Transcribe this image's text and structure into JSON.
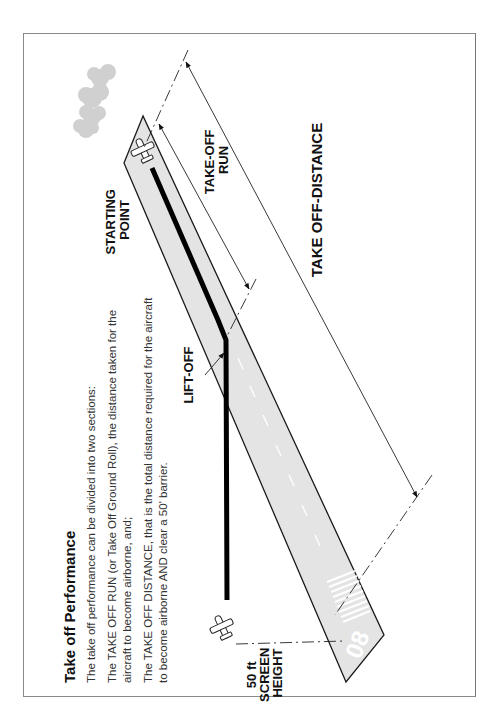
{
  "title": "Take off Performance",
  "paragraphs": [
    [
      "The take off performance can be divided into two sections:"
    ],
    [
      "The TAKE OFF RUN (or Take Off Ground Roll), the distance taken for the",
      "aircraft to become airborne, and;"
    ],
    [
      "The TAKE OFF DISTANCE, that is the total distance required for the aircraft",
      "to become airborne AND clear a 50' barrier."
    ]
  ],
  "labels": {
    "starting_point": [
      "STARTING",
      "POINT"
    ],
    "take_off_run": [
      "TAKE-OFF",
      "RUN"
    ],
    "take_off_distance": "TAKE OFF-DISTANCE",
    "lift_off": "LIFT-OFF",
    "screen_height": [
      "50 ft",
      "SCREEN",
      "HEIGHT"
    ],
    "runway_number": "08"
  },
  "colors": {
    "runway_fill": "#e4e4e4",
    "runway_edge": "#1a1a1a",
    "ground_track": "#000000",
    "trees": "#cfcfcf",
    "frame": "#8a8a8a"
  }
}
